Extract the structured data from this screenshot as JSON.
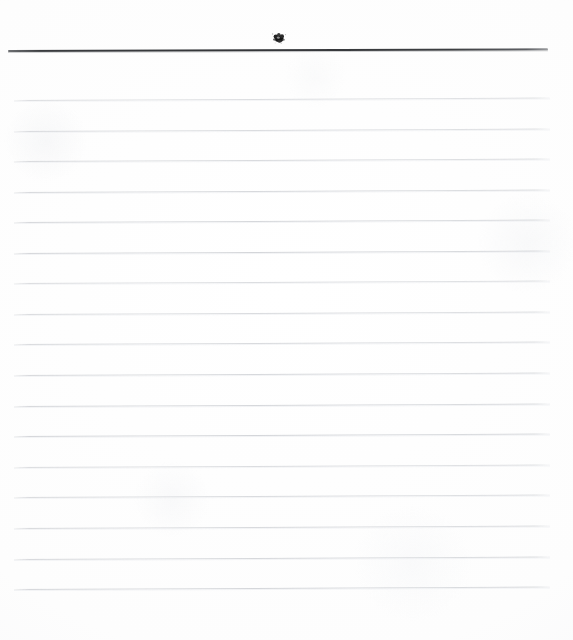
{
  "document": {
    "type": "ruled-notebook-paper",
    "title": "Blank ruled writing paper",
    "page_width": 573,
    "page_height": 640,
    "background_color": "#ffffff",
    "content_text": "",
    "is_blank": true
  },
  "header_rule": {
    "name": "top-margin-rule",
    "color": "#343639",
    "x_start": 8,
    "x_end": 548,
    "y": 50,
    "thickness": 2,
    "skew_degrees": -0.18
  },
  "ink_blot": {
    "name": "ink-smudge",
    "color": "#1a1a1a",
    "x": 270,
    "y": 30,
    "width": 18,
    "height": 15,
    "description": "small ink blot / smudge above the top rule"
  },
  "ruled_lines": {
    "name": "writing-lines",
    "color": "#d7d9dc",
    "count": 17,
    "x_start": 14,
    "x_end": 550,
    "first_y": 100,
    "spacing": 30.6,
    "skew_degrees": -0.26,
    "y_positions": [
      100,
      131,
      161,
      192,
      222,
      253,
      283,
      314,
      344,
      375,
      406,
      436,
      467,
      497,
      528,
      559,
      589
    ]
  },
  "margins": {
    "top": 50,
    "left": 14,
    "right": 23,
    "bottom": 51
  }
}
